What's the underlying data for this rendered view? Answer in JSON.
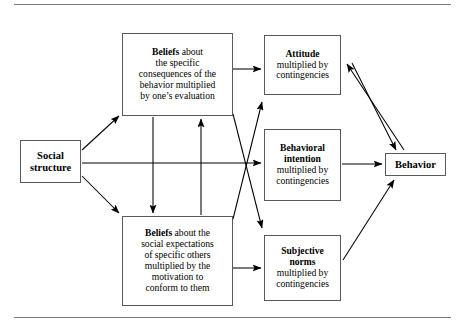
{
  "figure": {
    "title_rule_top": "",
    "title_rule_bottom": ""
  },
  "nodes": {
    "social_structure": {
      "name": "social-structure",
      "lines": [
        "Social",
        "structure"
      ]
    },
    "beliefs_consequences": {
      "name": "beliefs-about-consequences",
      "lead": "Beliefs",
      "lines": [
        " about",
        "the specific",
        "consequences of the",
        "behavior multiplied",
        "by one’s evaluation"
      ]
    },
    "beliefs_normative": {
      "name": "beliefs-about-social-expectations",
      "lead": "Beliefs",
      "lines": [
        " about the",
        "social expectations",
        "of specific others",
        "multiplied by the",
        "motivation to",
        "conform to them"
      ]
    },
    "attitude": {
      "name": "attitude",
      "lead": "Attitude",
      "lines": [
        "multiplied by",
        "contingencies"
      ]
    },
    "behavioral_intention": {
      "name": "behavioral-intention",
      "lead_lines": [
        "Behavioral",
        "intention"
      ],
      "lines": [
        "multiplied by",
        "contingencies"
      ]
    },
    "subjective_norms": {
      "name": "subjective-norms",
      "lead_lines": [
        "Subjective",
        "norms"
      ],
      "lines": [
        "multiplied by",
        "contingencies"
      ]
    },
    "behavior": {
      "name": "behavior",
      "lines": [
        "Behavior"
      ]
    }
  },
  "edges": [
    {
      "from": "social_structure",
      "to": "beliefs_consequences",
      "style": "arrow"
    },
    {
      "from": "social_structure",
      "to": "behavioral_intention",
      "style": "arrow"
    },
    {
      "from": "social_structure",
      "to": "beliefs_normative",
      "style": "arrow"
    },
    {
      "from": "beliefs_consequences",
      "to": "attitude",
      "style": "arrow"
    },
    {
      "from": "beliefs_consequences",
      "to": "beliefs_normative",
      "style": "arrow"
    },
    {
      "from": "beliefs_normative",
      "to": "beliefs_consequences",
      "style": "arrow"
    },
    {
      "from": "beliefs_consequences",
      "to": "subjective_norms",
      "style": "arrow"
    },
    {
      "from": "beliefs_normative",
      "to": "attitude",
      "style": "arrow"
    },
    {
      "from": "beliefs_normative",
      "to": "subjective_norms",
      "style": "arrow"
    },
    {
      "from": "behavioral_intention",
      "to": "behavior",
      "style": "arrow"
    },
    {
      "from": "attitude",
      "to": "behavior",
      "style": "arrow"
    },
    {
      "from": "behavior",
      "to": "attitude",
      "style": "arrow"
    },
    {
      "from": "subjective_norms",
      "to": "behavior",
      "style": "arrow"
    }
  ],
  "colors": {
    "line": "#000000",
    "box_border": "#59595b",
    "rule": "#7a7a7a",
    "background": "#ffffff"
  }
}
